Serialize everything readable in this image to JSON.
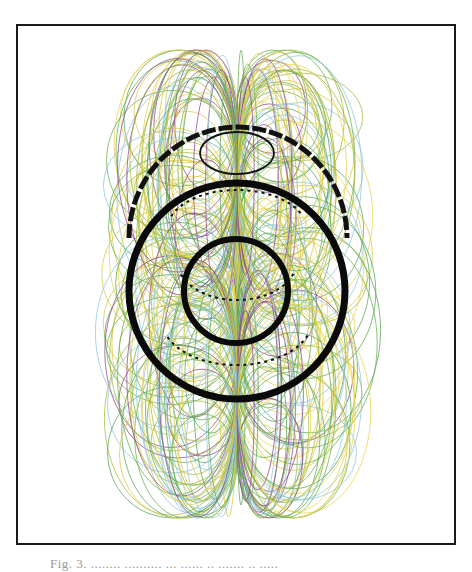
{
  "figure": {
    "frame": {
      "x": 16,
      "y": 24,
      "width": 439,
      "height": 520,
      "stroke": "#1a1a1a"
    },
    "axis_x": 237,
    "loops": {
      "palette": [
        "#6ab04c",
        "#8e4a8f",
        "#e8d44d",
        "#8fc7dc",
        "#a6b93a",
        "#5aa55a",
        "#d9c94a"
      ],
      "count_per_side": 90,
      "outer_extent_left": 90,
      "outer_extent_right": 386,
      "top": 50,
      "bottom": 518,
      "stroke_width": 0.9,
      "opacity": 0.85
    },
    "rings": [
      {
        "name": "outer-ring",
        "cx": 237,
        "cy": 291,
        "r": 108,
        "stroke": "#0a0a0a",
        "stroke_width": 7
      },
      {
        "name": "inner-ring",
        "cx": 236,
        "cy": 291,
        "r": 52,
        "stroke": "#0a0a0a",
        "stroke_width": 6
      }
    ],
    "dashed_arcs": [
      {
        "name": "upper-dashed-arc",
        "cx": 238,
        "cy": 238,
        "rx": 109,
        "ry": 111,
        "start_deg": 180,
        "end_deg": 360,
        "stroke": "#111111",
        "stroke_width": 5,
        "dash": "14 3"
      },
      {
        "name": "inner-dotted-arc-1",
        "cx": 237,
        "cy": 260,
        "rx": 60,
        "ry": 40,
        "start_deg": 20,
        "end_deg": 160,
        "stroke": "#111111",
        "stroke_width": 2,
        "dash": "3 4"
      },
      {
        "name": "inner-dotted-arc-2",
        "cx": 237,
        "cy": 320,
        "rx": 75,
        "ry": 45,
        "start_deg": 20,
        "end_deg": 160,
        "stroke": "#111111",
        "stroke_width": 2,
        "dash": "3 4"
      },
      {
        "name": "inner-dotted-arc-3",
        "cx": 237,
        "cy": 230,
        "rx": 70,
        "ry": 40,
        "start_deg": 200,
        "end_deg": 340,
        "stroke": "#111111",
        "stroke_width": 2,
        "dash": "3 4"
      }
    ],
    "small_ellipse": {
      "cx": 237,
      "cy": 153,
      "rx": 37,
      "ry": 21,
      "stroke": "#111111",
      "stroke_width": 1.8
    }
  },
  "caption": {
    "text": "Fig. 3. ........ ..........  ... ...... .. ....... .. ....."
  }
}
